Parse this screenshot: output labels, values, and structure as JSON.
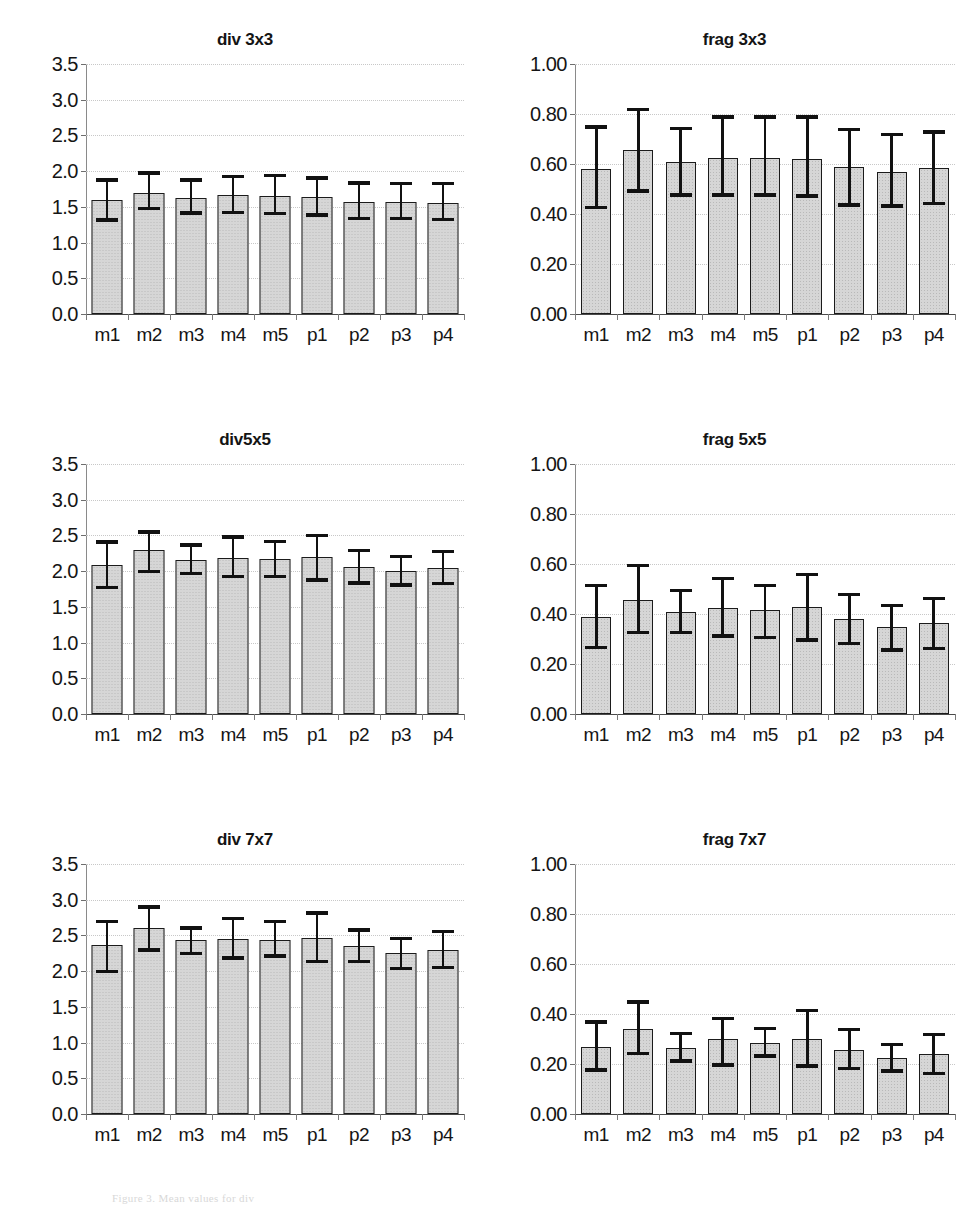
{
  "figure": {
    "caption": "Figure 3. Mean values for div"
  },
  "chart_data": [
    {
      "type": "bar",
      "title": "div 3x3",
      "xlabel": "",
      "ylabel": "",
      "ylim": [
        0.0,
        3.5
      ],
      "ytick_step": 0.5,
      "ytick_labels": [
        "0.0",
        "0.5",
        "1.0",
        "1.5",
        "2.0",
        "2.5",
        "3.0",
        "3.5"
      ],
      "grid": true,
      "legend": "none",
      "categories": [
        "m1",
        "m2",
        "m3",
        "m4",
        "m5",
        "p1",
        "p2",
        "p3",
        "p4"
      ],
      "values": [
        1.59,
        1.7,
        1.63,
        1.66,
        1.65,
        1.64,
        1.57,
        1.57,
        1.56
      ],
      "error_upper": [
        1.9,
        2.0,
        1.9,
        1.95,
        1.96,
        1.93,
        1.86,
        1.85,
        1.85
      ],
      "error_lower": [
        1.29,
        1.45,
        1.39,
        1.4,
        1.38,
        1.36,
        1.31,
        1.31,
        1.3
      ],
      "error_type": "standard deviation"
    },
    {
      "type": "bar",
      "title": "frag 3x3",
      "xlabel": "",
      "ylabel": "",
      "ylim": [
        0.0,
        1.0
      ],
      "ytick_step": 0.2,
      "ytick_labels": [
        "0.00",
        "0.20",
        "0.40",
        "0.60",
        "0.80",
        "1.00"
      ],
      "grid": true,
      "legend": "none",
      "categories": [
        "m1",
        "m2",
        "m3",
        "m4",
        "m5",
        "p1",
        "p2",
        "p3",
        "p4"
      ],
      "values": [
        0.58,
        0.655,
        0.61,
        0.625,
        0.625,
        0.62,
        0.59,
        0.57,
        0.585
      ],
      "error_upper": [
        0.755,
        0.825,
        0.75,
        0.795,
        0.795,
        0.795,
        0.745,
        0.725,
        0.735
      ],
      "error_lower": [
        0.42,
        0.485,
        0.47,
        0.47,
        0.47,
        0.465,
        0.43,
        0.425,
        0.435
      ],
      "error_type": "standard deviation"
    },
    {
      "type": "bar",
      "title": "div5x5",
      "xlabel": "",
      "ylabel": "",
      "ylim": [
        0.0,
        3.5
      ],
      "ytick_step": 0.5,
      "ytick_labels": [
        "0.0",
        "0.5",
        "1.0",
        "1.5",
        "2.0",
        "2.5",
        "3.0",
        "3.5"
      ],
      "grid": true,
      "legend": "none",
      "categories": [
        "m1",
        "m2",
        "m3",
        "m4",
        "m5",
        "p1",
        "p2",
        "p3",
        "p4"
      ],
      "values": [
        2.08,
        2.3,
        2.16,
        2.18,
        2.17,
        2.2,
        2.06,
        2.0,
        2.05
      ],
      "error_upper": [
        2.43,
        2.57,
        2.39,
        2.5,
        2.44,
        2.52,
        2.31,
        2.23,
        2.3
      ],
      "error_lower": [
        1.75,
        1.97,
        1.94,
        1.9,
        1.9,
        1.85,
        1.81,
        1.78,
        1.8
      ],
      "error_type": "standard deviation"
    },
    {
      "type": "bar",
      "title": "frag 5x5",
      "xlabel": "",
      "ylabel": "",
      "ylim": [
        0.0,
        1.0
      ],
      "ytick_step": 0.2,
      "ytick_labels": [
        "0.00",
        "0.20",
        "0.40",
        "0.60",
        "0.80",
        "1.00"
      ],
      "grid": true,
      "legend": "none",
      "categories": [
        "m1",
        "m2",
        "m3",
        "m4",
        "m5",
        "p1",
        "p2",
        "p3",
        "p4"
      ],
      "values": [
        0.39,
        0.455,
        0.41,
        0.425,
        0.415,
        0.43,
        0.38,
        0.35,
        0.365
      ],
      "error_upper": [
        0.52,
        0.6,
        0.5,
        0.55,
        0.52,
        0.565,
        0.485,
        0.44,
        0.47
      ],
      "error_lower": [
        0.26,
        0.32,
        0.32,
        0.305,
        0.3,
        0.29,
        0.275,
        0.25,
        0.255
      ],
      "error_type": "standard deviation"
    },
    {
      "type": "bar",
      "title": "div 7x7",
      "xlabel": "",
      "ylabel": "",
      "ylim": [
        0.0,
        3.5
      ],
      "ytick_step": 0.5,
      "ytick_labels": [
        "0.0",
        "0.5",
        "1.0",
        "1.5",
        "2.0",
        "2.5",
        "3.0",
        "3.5"
      ],
      "grid": true,
      "legend": "none",
      "categories": [
        "m1",
        "m2",
        "m3",
        "m4",
        "m5",
        "p1",
        "p2",
        "p3",
        "p4"
      ],
      "values": [
        2.36,
        2.6,
        2.43,
        2.45,
        2.44,
        2.46,
        2.35,
        2.25,
        2.3
      ],
      "error_upper": [
        2.72,
        2.92,
        2.63,
        2.76,
        2.72,
        2.84,
        2.6,
        2.48,
        2.58
      ],
      "error_lower": [
        1.97,
        2.27,
        2.22,
        2.16,
        2.19,
        2.11,
        2.11,
        2.01,
        2.03
      ],
      "error_type": "standard deviation"
    },
    {
      "type": "bar",
      "title": "frag 7x7",
      "xlabel": "",
      "ylabel": "",
      "ylim": [
        0.0,
        1.0
      ],
      "ytick_step": 0.2,
      "ytick_labels": [
        "0.00",
        "0.20",
        "0.40",
        "0.60",
        "0.80",
        "1.00"
      ],
      "grid": true,
      "legend": "none",
      "categories": [
        "m1",
        "m2",
        "m3",
        "m4",
        "m5",
        "p1",
        "p2",
        "p3",
        "p4"
      ],
      "values": [
        0.27,
        0.34,
        0.265,
        0.3,
        0.285,
        0.3,
        0.255,
        0.225,
        0.24
      ],
      "error_upper": [
        0.375,
        0.455,
        0.33,
        0.39,
        0.35,
        0.42,
        0.345,
        0.285,
        0.325
      ],
      "error_lower": [
        0.17,
        0.235,
        0.205,
        0.19,
        0.225,
        0.185,
        0.175,
        0.165,
        0.155
      ],
      "error_type": "standard deviation"
    }
  ]
}
